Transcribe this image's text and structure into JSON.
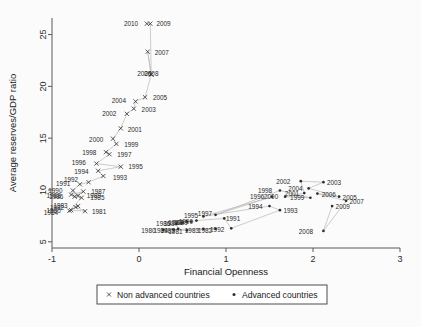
{
  "chart_data": {
    "type": "scatter",
    "title": "",
    "xlabel": "Financial Openness",
    "ylabel": "Average reserves/GDP ratio",
    "xlim": [
      -1,
      3
    ],
    "ylim": [
      4.4,
      26.6
    ],
    "xticks": [
      -1,
      0,
      1,
      2,
      3
    ],
    "xticklabels": [
      "-1",
      "0",
      "1",
      "2",
      "3"
    ],
    "yticks": [
      5,
      10,
      15,
      20,
      25
    ],
    "yticklabels": [
      "5",
      "10",
      "15",
      "20",
      "25"
    ],
    "grid": false,
    "legend_position": "below-axes",
    "series": [
      {
        "name": "Non advanced countries",
        "marker": "x",
        "color": "#3a3a3a",
        "points": [
          {
            "label": "1980",
            "x": -0.78,
            "y": 8.05,
            "lx": -0.9,
            "ly": 7.95,
            "anchor": "end"
          },
          {
            "label": "1981",
            "x": -0.62,
            "y": 7.95,
            "lx": -0.54,
            "ly": 7.88,
            "anchor": "start"
          },
          {
            "label": "1982",
            "x": -0.73,
            "y": 8.35,
            "lx": -0.86,
            "ly": 8.28,
            "anchor": "end"
          },
          {
            "label": "1983",
            "x": -0.7,
            "y": 8.45,
            "lx": -0.82,
            "ly": 8.5,
            "anchor": "end"
          },
          {
            "label": "1984",
            "x": -0.8,
            "y": 8.0,
            "lx": -0.93,
            "ly": 7.8,
            "anchor": "end"
          },
          {
            "label": "1985",
            "x": -0.66,
            "y": 9.25,
            "lx": -0.56,
            "ly": 9.2,
            "anchor": "start"
          },
          {
            "label": "1986",
            "x": -0.74,
            "y": 9.35,
            "lx": -0.87,
            "ly": 9.3,
            "anchor": "end"
          },
          {
            "label": "1987",
            "x": -0.64,
            "y": 9.85,
            "lx": -0.55,
            "ly": 9.8,
            "anchor": "start"
          },
          {
            "label": "1988",
            "x": -0.78,
            "y": 9.55,
            "lx": -0.9,
            "ly": 9.48,
            "anchor": "end"
          },
          {
            "label": "1989",
            "x": -0.7,
            "y": 9.45,
            "lx": -0.6,
            "ly": 9.4,
            "anchor": "start"
          },
          {
            "label": "1990",
            "x": -0.76,
            "y": 9.95,
            "lx": -0.88,
            "ly": 9.95,
            "anchor": "end"
          },
          {
            "label": "1991",
            "x": -0.68,
            "y": 10.55,
            "lx": -0.79,
            "ly": 10.6,
            "anchor": "end"
          },
          {
            "label": "1992",
            "x": -0.58,
            "y": 10.75,
            "lx": -0.7,
            "ly": 10.95,
            "anchor": "end"
          },
          {
            "label": "1993",
            "x": -0.41,
            "y": 11.35,
            "lx": -0.3,
            "ly": 11.15,
            "anchor": "start"
          },
          {
            "label": "1994",
            "x": -0.47,
            "y": 11.85,
            "lx": -0.58,
            "ly": 11.75,
            "anchor": "end"
          },
          {
            "label": "1995",
            "x": -0.21,
            "y": 12.25,
            "lx": -0.12,
            "ly": 12.2,
            "anchor": "start"
          },
          {
            "label": "1996",
            "x": -0.49,
            "y": 12.55,
            "lx": -0.61,
            "ly": 12.6,
            "anchor": "end"
          },
          {
            "label": "1997",
            "x": -0.34,
            "y": 13.45,
            "lx": -0.25,
            "ly": 13.35,
            "anchor": "start"
          },
          {
            "label": "1998",
            "x": -0.38,
            "y": 13.65,
            "lx": -0.49,
            "ly": 13.6,
            "anchor": "end"
          },
          {
            "label": "1999",
            "x": -0.26,
            "y": 14.45,
            "lx": -0.17,
            "ly": 14.4,
            "anchor": "start"
          },
          {
            "label": "2000",
            "x": -0.3,
            "y": 14.95,
            "lx": -0.41,
            "ly": 14.85,
            "anchor": "end"
          },
          {
            "label": "2001",
            "x": -0.21,
            "y": 15.95,
            "lx": -0.13,
            "ly": 15.85,
            "anchor": "start"
          },
          {
            "label": "2002",
            "x": -0.14,
            "y": 17.35,
            "lx": -0.26,
            "ly": 17.4,
            "anchor": "end"
          },
          {
            "label": "2003",
            "x": -0.06,
            "y": 17.85,
            "lx": 0.03,
            "ly": 17.75,
            "anchor": "start"
          },
          {
            "label": "2004",
            "x": -0.04,
            "y": 18.55,
            "lx": -0.15,
            "ly": 18.65,
            "anchor": "end"
          },
          {
            "label": "2005",
            "x": 0.07,
            "y": 18.95,
            "lx": 0.16,
            "ly": 18.9,
            "anchor": "start"
          },
          {
            "label": "2006",
            "x": 0.14,
            "y": 21.15,
            "lx": -0.02,
            "ly": 21.2,
            "anchor": "start"
          },
          {
            "label": "2008",
            "x": 0.14,
            "y": 21.15,
            "lx": 0.06,
            "ly": 21.2,
            "anchor": "start"
          },
          {
            "label": "2007",
            "x": 0.1,
            "y": 23.35,
            "lx": 0.18,
            "ly": 23.25,
            "anchor": "start"
          },
          {
            "label": "2009",
            "x": 0.13,
            "y": 26.05,
            "lx": 0.2,
            "ly": 26.0,
            "anchor": "start"
          },
          {
            "label": "2010",
            "x": 0.09,
            "y": 26.05,
            "lx": -0.01,
            "ly": 26.0,
            "anchor": "end"
          }
        ]
      },
      {
        "name": "Advanced countries",
        "marker": "dot",
        "color": "#2e2e2e",
        "points": [
          {
            "label": "1980",
            "x": 0.28,
            "y": 6.15,
            "lx": 0.19,
            "ly": 6.05,
            "anchor": "end"
          },
          {
            "label": "1981",
            "x": 0.55,
            "y": 6.1,
            "lx": 0.5,
            "ly": 5.98,
            "anchor": "end"
          },
          {
            "label": "1982",
            "x": 0.88,
            "y": 6.25,
            "lx": 0.84,
            "ly": 6.1,
            "anchor": "end"
          },
          {
            "label": "1983",
            "x": 0.74,
            "y": 6.25,
            "lx": 0.69,
            "ly": 6.1,
            "anchor": "end"
          },
          {
            "label": "1984",
            "x": 0.4,
            "y": 6.18,
            "lx": 0.33,
            "ly": 6.05,
            "anchor": "end"
          },
          {
            "label": "1985",
            "x": 0.45,
            "y": 6.25,
            "lx": 0.41,
            "ly": 6.1,
            "anchor": "end"
          },
          {
            "label": "1986",
            "x": 0.43,
            "y": 6.75,
            "lx": 0.36,
            "ly": 6.72,
            "anchor": "end"
          },
          {
            "label": "1987",
            "x": 0.5,
            "y": 6.85,
            "lx": 0.45,
            "ly": 6.78,
            "anchor": "end"
          },
          {
            "label": "1988",
            "x": 0.55,
            "y": 6.95,
            "lx": 0.5,
            "ly": 6.88,
            "anchor": "end"
          },
          {
            "label": "1989",
            "x": 0.6,
            "y": 6.95,
            "lx": 0.56,
            "ly": 6.85,
            "anchor": "end"
          },
          {
            "label": "1990",
            "x": 0.66,
            "y": 7.05,
            "lx": 0.62,
            "ly": 6.95,
            "anchor": "end"
          },
          {
            "label": "1991",
            "x": 0.98,
            "y": 7.25,
            "lx": 1.0,
            "ly": 7.18,
            "anchor": "start"
          },
          {
            "label": "1992",
            "x": 1.06,
            "y": 6.3,
            "lx": 0.98,
            "ly": 6.15,
            "anchor": "end"
          },
          {
            "label": "1993",
            "x": 1.62,
            "y": 8.05,
            "lx": 1.66,
            "ly": 7.95,
            "anchor": "start"
          },
          {
            "label": "1994",
            "x": 1.5,
            "y": 8.45,
            "lx": 1.42,
            "ly": 8.35,
            "anchor": "end"
          },
          {
            "label": "1995",
            "x": 0.74,
            "y": 7.45,
            "lx": 0.68,
            "ly": 7.55,
            "anchor": "end"
          },
          {
            "label": "1996",
            "x": 1.53,
            "y": 9.35,
            "lx": 1.44,
            "ly": 9.3,
            "anchor": "end"
          },
          {
            "label": "1997",
            "x": 0.88,
            "y": 7.6,
            "lx": 0.84,
            "ly": 7.72,
            "anchor": "end"
          },
          {
            "label": "1998",
            "x": 1.62,
            "y": 9.95,
            "lx": 1.53,
            "ly": 9.92,
            "anchor": "end"
          },
          {
            "label": "1999",
            "x": 1.97,
            "y": 9.25,
            "lx": 1.9,
            "ly": 9.2,
            "anchor": "end"
          },
          {
            "label": "2000",
            "x": 1.68,
            "y": 9.35,
            "lx": 1.6,
            "ly": 9.3,
            "anchor": "end"
          },
          {
            "label": "2001",
            "x": 1.9,
            "y": 9.7,
            "lx": 1.84,
            "ly": 9.62,
            "anchor": "end"
          },
          {
            "label": "2002",
            "x": 1.86,
            "y": 10.85,
            "lx": 1.74,
            "ly": 10.8,
            "anchor": "end"
          },
          {
            "label": "2003",
            "x": 2.12,
            "y": 10.75,
            "lx": 2.16,
            "ly": 10.72,
            "anchor": "start"
          },
          {
            "label": "2004",
            "x": 1.95,
            "y": 10.15,
            "lx": 1.88,
            "ly": 10.1,
            "anchor": "end"
          },
          {
            "label": "2005",
            "x": 2.3,
            "y": 9.35,
            "lx": 2.34,
            "ly": 9.28,
            "anchor": "start"
          },
          {
            "label": "2006",
            "x": 2.05,
            "y": 9.65,
            "lx": 2.1,
            "ly": 9.58,
            "anchor": "start"
          },
          {
            "label": "2007",
            "x": 2.38,
            "y": 8.95,
            "lx": 2.42,
            "ly": 8.88,
            "anchor": "start"
          },
          {
            "label": "2009",
            "x": 2.22,
            "y": 8.45,
            "lx": 2.26,
            "ly": 8.38,
            "anchor": "start"
          },
          {
            "label": "2008",
            "x": 2.12,
            "y": 6.05,
            "lx": 2.0,
            "ly": 6.0,
            "anchor": "end"
          }
        ]
      }
    ]
  },
  "legend": {
    "entries": [
      {
        "marker": "x",
        "label": "Non advanced countries"
      },
      {
        "marker": "dot",
        "label": "Advanced countries"
      }
    ]
  }
}
